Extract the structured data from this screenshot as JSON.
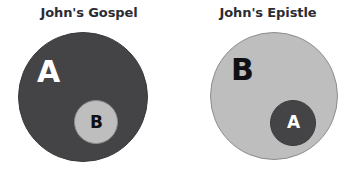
{
  "background_color": "#ffffff",
  "palette": {
    "dark_gray": "#444446",
    "light_gray": "#bebebe",
    "title_text": "#2b2b33",
    "label_white": "#ffffff",
    "label_black": "#101014"
  },
  "panels": [
    {
      "title": "John's Gospel",
      "outer": {
        "label": "A",
        "fill": "#444446",
        "label_color": "#ffffff"
      },
      "inner": {
        "label": "B",
        "fill": "#bebebe",
        "label_color": "#101014"
      }
    },
    {
      "title": "John's Epistle",
      "outer": {
        "label": "B",
        "fill": "#bebebe",
        "label_color": "#101014"
      },
      "inner": {
        "label": "A",
        "fill": "#444446",
        "label_color": "#ffffff"
      }
    }
  ],
  "chart_data": {
    "type": "diagram",
    "subtype": "euler-nested-sets",
    "title": "",
    "panels": [
      {
        "title": "John's Gospel",
        "sets": [
          {
            "name": "A",
            "role": "outer",
            "contains": "B",
            "radius_px": 65,
            "center_px": [
              83,
              97
            ],
            "fill": "#444446"
          },
          {
            "name": "B",
            "role": "inner",
            "radius_px": 22,
            "center_px": [
              96,
              122
            ],
            "fill": "#bebebe"
          }
        ],
        "relation": "B is a proper subset of A"
      },
      {
        "title": "John's Epistle",
        "sets": [
          {
            "name": "B",
            "role": "outer",
            "contains": "A",
            "radius_px": 64,
            "center_px": [
              274,
              97
            ],
            "fill": "#bebebe"
          },
          {
            "name": "A",
            "role": "inner",
            "radius_px": 23,
            "center_px": [
              293,
              122
            ],
            "fill": "#444446"
          }
        ],
        "relation": "A is a proper subset of B"
      }
    ],
    "legend": [],
    "annotations": []
  }
}
